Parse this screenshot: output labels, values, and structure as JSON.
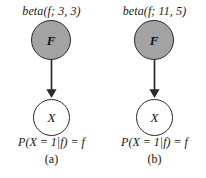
{
  "figure": {
    "background_color": "#ffffff",
    "node_fill_observed": "#a3a3a3",
    "node_fill_hidden": "#ffffff",
    "node_stroke": "#2a2a2a"
  },
  "panels": [
    {
      "prior_label": "beta(f; 3, 3)",
      "parent_node": "F",
      "child_node": "X",
      "equation": "P(X = 1|f) = f",
      "caption": "(a)"
    },
    {
      "prior_label": "beta(f; 11, 5)",
      "parent_node": "F",
      "child_node": "X",
      "equation": "P(X = 1|f) = f",
      "caption": "(b)"
    }
  ]
}
